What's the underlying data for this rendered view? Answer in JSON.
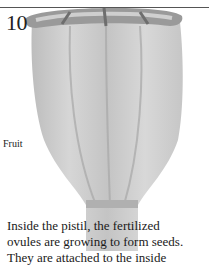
{
  "page": {
    "number": "10",
    "figure_label": "Fruit",
    "caption_lines": [
      "Inside the pistil, the fertilized",
      "ovules are growing to form seeds.",
      "They are attached to the inside"
    ]
  },
  "illustration": {
    "subject": "poppy seed pod (fruit)",
    "colors": {
      "pod_light": "#d9d9d9",
      "pod_mid": "#b5b5b5",
      "pod_dark": "#8a8a8a",
      "rule": "#555555"
    }
  }
}
